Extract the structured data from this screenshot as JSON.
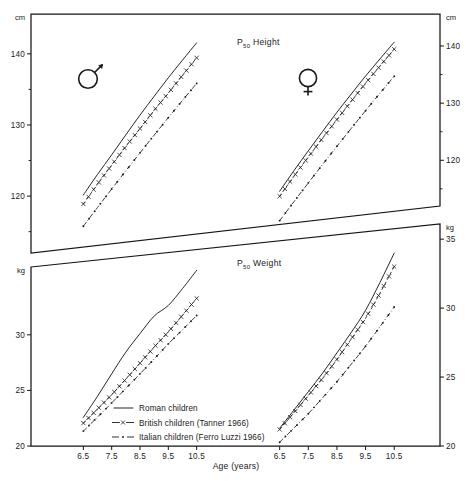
{
  "figure": {
    "xaxis_title": "Age (years)",
    "unit_height": "cm",
    "unit_weight": "kg",
    "male_symbol": "male-symbol",
    "female_symbol": "female-symbol"
  },
  "legend": {
    "items": [
      {
        "label": "Roman children",
        "style": "solid",
        "marker": "none"
      },
      {
        "label": "British children (Tanner 1966)",
        "style": "dashed",
        "marker": "x"
      },
      {
        "label": "Italian children (Ferro Luzzi 1966)",
        "style": "dash-dot",
        "marker": "dot"
      }
    ]
  },
  "chart_data": [
    {
      "type": "line",
      "title": "P50 Height",
      "title_prefix": "P",
      "title_subscript": "50",
      "title_suffix": "Height",
      "ylabel": "cm",
      "xlabel": "Age (years)",
      "ylim": [
        112,
        145
      ],
      "yticks": [
        120,
        130,
        140
      ],
      "ytick_labels": [
        "120",
        "130",
        "140"
      ],
      "yticks_minor": [
        115,
        125,
        135
      ],
      "grid": false,
      "legend_position": "bottom-panel",
      "panels": [
        {
          "sex": "male",
          "symbol": "♂",
          "x": [
            6.5,
            7.0,
            7.5,
            8.0,
            8.5,
            9.0,
            9.5,
            10.0,
            10.5
          ],
          "xticks": [
            6.5,
            7.5,
            8.5,
            9.5,
            10.5
          ],
          "xtick_labels": [
            "6.5",
            "7.5",
            "8.5",
            "9.5",
            "10.5"
          ],
          "series": [
            {
              "name": "Roman children",
              "style": "solid",
              "marker": "none",
              "values": [
                119.5,
                122.3,
                125.0,
                127.8,
                130.6,
                133.3,
                136.0,
                138.6,
                141.2
              ]
            },
            {
              "name": "British children (Tanner 1966)",
              "style": "dashed",
              "marker": "x",
              "values": [
                118.2,
                120.9,
                123.5,
                126.1,
                128.6,
                131.2,
                133.7,
                136.3,
                138.9
              ]
            },
            {
              "name": "Italian children (Ferro Luzzi 1966)",
              "style": "dash-dot",
              "marker": "dot",
              "values": [
                115.0,
                117.5,
                120.0,
                122.5,
                125.0,
                127.5,
                130.0,
                132.5,
                135.0
              ]
            }
          ]
        },
        {
          "sex": "female",
          "symbol": "♀",
          "x": [
            6.5,
            7.0,
            7.5,
            8.0,
            8.5,
            9.0,
            9.5,
            10.0,
            10.5
          ],
          "xticks": [
            6.5,
            7.5,
            8.5,
            9.5,
            10.5
          ],
          "xtick_labels": [
            "6.5",
            "7.5",
            "8.5",
            "9.5",
            "10.5"
          ],
          "series": [
            {
              "name": "Roman children",
              "style": "solid",
              "marker": "none",
              "values": [
                117.3,
                120.4,
                123.4,
                126.4,
                129.4,
                132.3,
                135.2,
                138.0,
                140.8
              ]
            },
            {
              "name": "British children (Tanner 1966)",
              "style": "dashed",
              "marker": "x",
              "values": [
                116.5,
                119.5,
                122.4,
                125.3,
                128.2,
                131.1,
                134.0,
                136.8,
                139.6
              ]
            },
            {
              "name": "Italian children (Ferro Luzzi 1966)",
              "style": "dash-dot",
              "marker": "dot",
              "values": [
                112.6,
                115.4,
                118.2,
                121.0,
                123.8,
                126.6,
                129.4,
                132.2,
                135.0
              ]
            }
          ]
        }
      ]
    },
    {
      "type": "line",
      "title": "P50 Weight",
      "title_prefix": "P",
      "title_subscript": "50",
      "title_suffix": "Weight",
      "ylabel": "kg",
      "xlabel": "Age (years)",
      "ylim": [
        20,
        36
      ],
      "yticks": [
        20,
        25,
        30,
        35
      ],
      "ytick_labels_left": [
        "20",
        "25",
        "30"
      ],
      "ytick_labels_right": [
        "20",
        "25",
        "30",
        "35"
      ],
      "grid": false,
      "legend_position": "inside-lower-left",
      "panels": [
        {
          "sex": "male",
          "symbol": "♂",
          "x": [
            6.5,
            7.0,
            7.5,
            8.0,
            8.5,
            9.0,
            9.5,
            10.0,
            10.5
          ],
          "xticks": [
            6.5,
            7.5,
            8.5,
            9.5,
            10.5
          ],
          "xtick_labels": [
            "6.5",
            "7.5",
            "8.5",
            "9.5",
            "10.5"
          ],
          "series": [
            {
              "name": "Roman children",
              "style": "solid",
              "marker": "none",
              "values": [
                22.5,
                24.3,
                26.2,
                28.0,
                29.5,
                30.9,
                31.7,
                33.0,
                34.4
              ]
            },
            {
              "name": "British children (Tanner 1966)",
              "style": "dashed",
              "marker": "x",
              "values": [
                22.0,
                23.2,
                24.4,
                25.7,
                27.0,
                28.3,
                29.5,
                30.8,
                32.1
              ]
            },
            {
              "name": "Italian children (Ferro Luzzi 1966)",
              "style": "dash-dot",
              "marker": "dot",
              "values": [
                21.3,
                22.5,
                23.7,
                24.9,
                26.1,
                27.3,
                28.5,
                29.6,
                30.7
              ]
            }
          ]
        },
        {
          "sex": "female",
          "symbol": "♀",
          "x": [
            6.5,
            7.0,
            7.5,
            8.0,
            8.5,
            9.0,
            9.5,
            10.0,
            10.5
          ],
          "xticks": [
            6.5,
            7.5,
            8.5,
            9.5,
            10.5
          ],
          "xtick_labels": [
            "6.5",
            "7.5",
            "8.5",
            "9.5",
            "10.5"
          ],
          "series": [
            {
              "name": "Roman children",
              "style": "solid",
              "marker": "none",
              "values": [
                21.4,
                22.8,
                24.2,
                25.6,
                27.1,
                28.6,
                30.2,
                32.2,
                34.3
              ]
            },
            {
              "name": "British children (Tanner 1966)",
              "style": "dashed",
              "marker": "x",
              "values": [
                21.3,
                22.6,
                23.9,
                25.2,
                26.6,
                28.1,
                29.6,
                31.4,
                33.3
              ]
            },
            {
              "name": "Italian children (Ferro Luzzi 1966)",
              "style": "dash-dot",
              "marker": "dot",
              "values": [
                20.3,
                21.4,
                22.5,
                23.7,
                24.9,
                26.2,
                27.5,
                28.9,
                30.3
              ]
            }
          ]
        }
      ]
    }
  ]
}
